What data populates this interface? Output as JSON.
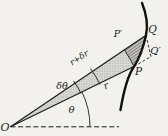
{
  "figure_labels": {
    "origin": "O",
    "theta": "θ",
    "delta_theta": "δθ",
    "r": "r",
    "r_plus_dr": "r+δr",
    "p_prime": "P′",
    "q": "Q",
    "q_prime": "Q′",
    "p": "P"
  },
  "colors": {
    "paper": "#f2f1ee",
    "ink": "#1c1c1c",
    "stipple_fill": "#dbd9d5",
    "stipple_dot": "#95928e",
    "hatch_fill": "#d0cec9",
    "hatch_line": "#57544f"
  }
}
